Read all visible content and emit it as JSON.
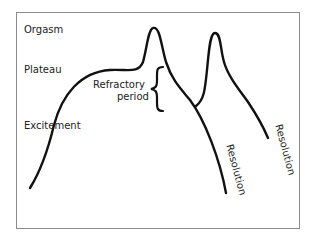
{
  "diagram": {
    "labels": {
      "orgasm": "Orgasm",
      "plateau": "Plateau",
      "excitement": "Excitement",
      "refractory_line1": "Refractory",
      "refractory_line2": "period",
      "resolution_1": "Resolution",
      "resolution_2": "Resolution"
    },
    "colors": {
      "curve": "#111111",
      "frame": "#8a8a8a",
      "text": "#222222"
    }
  }
}
